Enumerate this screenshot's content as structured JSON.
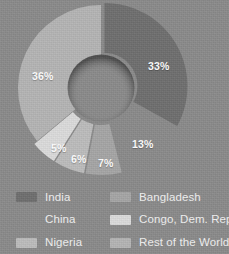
{
  "background_color": "#8b8b8b",
  "chart_data": {
    "type": "pie",
    "variant": "donut",
    "title": "",
    "subtitle": "",
    "xlabel": "",
    "ylabel": "",
    "legend_position": "bottom",
    "grid": false,
    "start_angle_deg": 0,
    "direction": "clockwise",
    "units": "percent",
    "categories": [
      "India",
      "China",
      "Bangladesh",
      "Nigeria",
      "Congo, Dem. Rep.",
      "Rest of the World"
    ],
    "values": [
      33,
      13,
      7,
      6,
      5,
      36
    ],
    "labels": [
      "33%",
      "13%",
      "7%",
      "6%",
      "5%",
      "36%"
    ],
    "colors": [
      "#6f6f6f",
      "#8b8b8b",
      "#a6a6a6",
      "#bdbdbd",
      "#dcdcdc",
      "#b5b5b5"
    ],
    "exploded": [
      "India",
      "China",
      "Bangladesh",
      "Nigeria",
      "Congo, Dem. Rep."
    ],
    "slices": [
      {
        "name": "India",
        "value": 33,
        "label": "33%",
        "color": "#6f6f6f",
        "exploded": true
      },
      {
        "name": "China",
        "value": 13,
        "label": "13%",
        "color": "#8b8b8b",
        "exploded": true
      },
      {
        "name": "Bangladesh",
        "value": 7,
        "label": "7%",
        "color": "#a6a6a6",
        "exploded": true
      },
      {
        "name": "Nigeria",
        "value": 6,
        "label": "6%",
        "color": "#bdbdbd",
        "exploded": true
      },
      {
        "name": "Congo, Dem. Rep.",
        "value": 5,
        "label": "5%",
        "color": "#dcdcdc",
        "exploded": true
      },
      {
        "name": "Rest of the World",
        "value": 36,
        "label": "36%",
        "color": "#b5b5b5",
        "exploded": false
      }
    ]
  },
  "pct_labels": [
    {
      "text": "33%",
      "x": 148,
      "y": 60
    },
    {
      "text": "13%",
      "x": 132,
      "y": 138
    },
    {
      "text": "7%",
      "x": 98,
      "y": 157
    },
    {
      "text": "6%",
      "x": 71,
      "y": 153
    },
    {
      "text": "5%",
      "x": 51,
      "y": 142
    },
    {
      "text": "36%",
      "x": 32,
      "y": 70
    }
  ],
  "legend": {
    "columns": [
      {
        "items": [
          {
            "label": "India",
            "color": "#6f6f6f"
          },
          {
            "label": "China",
            "color": "#8b8b8b"
          },
          {
            "label": "Nigeria",
            "color": "#bdbdbd"
          }
        ]
      },
      {
        "items": [
          {
            "label": "Bangladesh",
            "color": "#a6a6a6"
          },
          {
            "label": "Congo, Dem. Rep.",
            "color": "#dcdcdc"
          },
          {
            "label": "Rest of the World",
            "color": "#b5b5b5"
          }
        ]
      }
    ]
  }
}
